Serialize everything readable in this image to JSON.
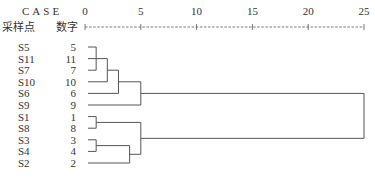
{
  "chart_data": {
    "type": "dendrogram",
    "header": {
      "case_label": "CASE",
      "sample_label": "采样点",
      "number_label": "数字"
    },
    "axis": {
      "title": "Rescaled Distance Cluster Combine",
      "ticks": [
        "0",
        "5",
        "10",
        "15",
        "20",
        "25"
      ],
      "tick_values": [
        0,
        5,
        10,
        15,
        20,
        25
      ],
      "range": [
        0,
        25
      ]
    },
    "leaves": [
      {
        "name": "S5",
        "num": "5"
      },
      {
        "name": "S11",
        "num": "11"
      },
      {
        "name": "S7",
        "num": "7"
      },
      {
        "name": "S10",
        "num": "10"
      },
      {
        "name": "S6",
        "num": "6"
      },
      {
        "name": "S9",
        "num": "9"
      },
      {
        "name": "S1",
        "num": "1"
      },
      {
        "name": "S8",
        "num": "8"
      },
      {
        "name": "S3",
        "num": "3"
      },
      {
        "name": "S4",
        "num": "4"
      },
      {
        "name": "S2",
        "num": "2"
      }
    ],
    "merges": [
      {
        "id": "m1",
        "children": [
          "S5",
          "S7"
        ],
        "distance": 1
      },
      {
        "id": "m2",
        "children": [
          "S11",
          "S10"
        ],
        "distance": 2
      },
      {
        "id": "m3",
        "children": [
          "m2",
          "S6"
        ],
        "distance": 3
      },
      {
        "id": "m4",
        "children": [
          "m3",
          "S9"
        ],
        "distance": 5
      },
      {
        "id": "m5",
        "children": [
          "S1",
          "S8"
        ],
        "distance": 1
      },
      {
        "id": "m6",
        "children": [
          "S3",
          "S4"
        ],
        "distance": 1
      },
      {
        "id": "m7",
        "children": [
          "m6",
          "S2"
        ],
        "distance": 4
      },
      {
        "id": "m8",
        "children": [
          "m5",
          "m7"
        ],
        "distance": 5
      },
      {
        "id": "m9",
        "children": [
          "m4",
          "m8"
        ],
        "distance": 25
      }
    ]
  }
}
